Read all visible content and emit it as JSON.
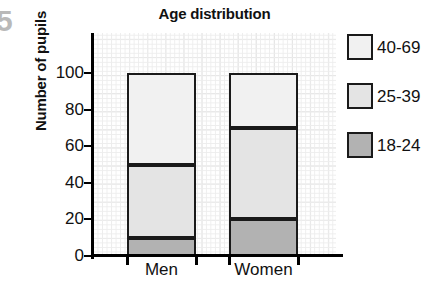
{
  "figure": {
    "fragment_glyph": "5"
  },
  "chart_data": {
    "type": "bar",
    "subtype": "stacked-bar",
    "title": "Age distribution",
    "xlabel": "",
    "ylabel": "Number of pupils",
    "categories": [
      "Men",
      "Women"
    ],
    "ylim": [
      0,
      110
    ],
    "yticks": [
      0,
      20,
      40,
      60,
      80,
      100
    ],
    "ytick_labels": [
      "0",
      "20",
      "40",
      "60",
      "80",
      "100"
    ],
    "grid": true,
    "grid_style": "graph-paper minor and major lines",
    "legend_position": "right",
    "stack_order_bottom_to_top": [
      "18-24",
      "25-39",
      "40-69"
    ],
    "series": [
      {
        "name": "18-24",
        "color": "#b2b2b2",
        "values": [
          10,
          20
        ]
      },
      {
        "name": "25-39",
        "color": "#e4e4e4",
        "values": [
          40,
          50
        ]
      },
      {
        "name": "40-69",
        "color": "#f1f1f1",
        "values": [
          50,
          30
        ]
      }
    ],
    "cumulative_boundaries": {
      "Men": [
        0,
        10,
        50,
        100
      ],
      "Women": [
        0,
        20,
        70,
        100
      ]
    },
    "totals": [
      100,
      100
    ]
  },
  "legend": {
    "items": [
      {
        "label": "40-69",
        "color": "#f1f1f1"
      },
      {
        "label": "25-39",
        "color": "#e4e4e4"
      },
      {
        "label": "18-24",
        "color": "#b2b2b2"
      }
    ]
  },
  "colors": {
    "axis": "#000000",
    "bar_outline": "#1a1a1a",
    "grid_minor": "#ededed",
    "grid_major": "#dcdcdc",
    "text": "#111111",
    "fragment": "#b9b9b9"
  }
}
